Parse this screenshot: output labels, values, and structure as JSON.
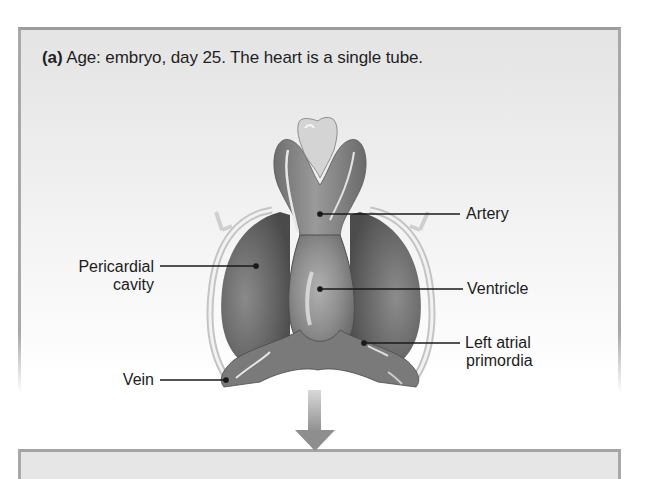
{
  "figure": {
    "panel_a": {
      "caption_letter": "(a)",
      "caption_text": " Age: embryo, day 25. The heart is a single tube.",
      "labels": {
        "artery": "Artery",
        "pericardial_line1": "Pericardial",
        "pericardial_line2": "cavity",
        "ventricle": "Ventricle",
        "left_atrial_line1": "Left atrial",
        "left_atrial_line2": "primordia",
        "vein": "Vein"
      }
    },
    "arrow": {
      "direction": "down"
    },
    "colors": {
      "panel_border": "#a8a8a8",
      "panel_bg_top": "#e4e4e4",
      "tissue_dark": "#5e5e5e",
      "tissue_mid": "#8a8a8a",
      "tissue_light": "#bdbdbd",
      "text": "#1c1c1c"
    }
  }
}
